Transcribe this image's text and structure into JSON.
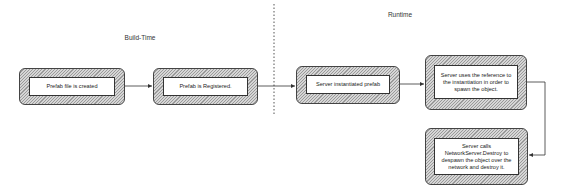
{
  "phases": {
    "build_time": "Build-Time",
    "runtime": "Runtime"
  },
  "nodes": [
    {
      "id": "prefab-created",
      "text": "Prefab file is created"
    },
    {
      "id": "prefab-registered",
      "text": "Prefab is Registered."
    },
    {
      "id": "server-instantiated",
      "text": "Server instantiated prefab"
    },
    {
      "id": "server-spawn",
      "text": "Server uses the reference to the instantiation in order to spawn the object."
    },
    {
      "id": "server-destroy",
      "text": "Server calls NetworkServer.Destroy to despawn the object over the network and destroy it."
    }
  ],
  "edges": [
    {
      "from": "prefab-created",
      "to": "prefab-registered"
    },
    {
      "from": "prefab-registered",
      "to": "server-instantiated"
    },
    {
      "from": "server-instantiated",
      "to": "server-spawn"
    },
    {
      "from": "server-spawn",
      "to": "server-destroy"
    }
  ],
  "colors": {
    "stroke": "#444444",
    "hatch_dark": "#9a9a9a",
    "hatch_light": "#d6d6d6",
    "background": "#ffffff"
  }
}
